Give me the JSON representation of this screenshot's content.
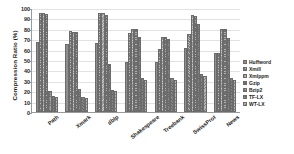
{
  "chart_data": {
    "type": "bar",
    "title": "",
    "xlabel": "",
    "ylabel": "Compression Ratio (%)",
    "ylim": [
      0,
      100
    ],
    "ytick_step": 10,
    "yticks": [
      0,
      10,
      20,
      30,
      40,
      50,
      60,
      70,
      80,
      90,
      100
    ],
    "grid": true,
    "legend_position": "right",
    "categories": [
      "Path",
      "Xmark",
      "dblp",
      "Shakespeare",
      "Treebank",
      "SwissProt",
      "News"
    ],
    "series": [
      {
        "name": "Huffword",
        "values": [
          67,
          65,
          66,
          48,
          48,
          62,
          57
        ]
      },
      {
        "name": "Xmill",
        "values": [
          95,
          78,
          95,
          76,
          61,
          75,
          57
        ]
      },
      {
        "name": "Xmlppm",
        "values": [
          95,
          77,
          95,
          80,
          72,
          93,
          80
        ]
      },
      {
        "name": "Gzip",
        "values": [
          94,
          77,
          93,
          80,
          72,
          92,
          80
        ]
      },
      {
        "name": "Bzip2",
        "values": [
          20,
          22,
          46,
          72,
          70,
          85,
          71
        ]
      },
      {
        "name": "TF-LX",
        "values": [
          15,
          14,
          21,
          33,
          33,
          37,
          33
        ]
      },
      {
        "name": "WT-LX",
        "values": [
          14,
          13,
          20,
          31,
          31,
          35,
          31
        ]
      }
    ]
  },
  "legend": {
    "entries": [
      {
        "label": "Huffword"
      },
      {
        "label": "Xmill"
      },
      {
        "label": "Xmlppm"
      },
      {
        "label": "Gzip"
      },
      {
        "label": "Bzip2"
      },
      {
        "label": "TF-LX"
      },
      {
        "label": "WT-LX"
      }
    ]
  }
}
